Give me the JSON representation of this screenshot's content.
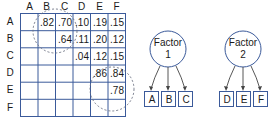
{
  "matrix": {
    "columns": [
      "A",
      "B",
      "C",
      "D",
      "E",
      "F"
    ],
    "rows": [
      "A",
      "B",
      "C",
      "D",
      "E",
      "F"
    ],
    "cells": [
      [
        "",
        ".82",
        ".70",
        ".10",
        ".19",
        ".15"
      ],
      [
        "",
        "",
        ".64",
        ".11",
        ".20",
        ".12"
      ],
      [
        "",
        "",
        "",
        ".04",
        ".12",
        ".15"
      ],
      [
        "",
        "",
        "",
        "",
        ".86",
        ".84"
      ],
      [
        "",
        "",
        "",
        "",
        "",
        ".78"
      ],
      [
        "",
        "",
        "",
        "",
        "",
        ""
      ]
    ],
    "line_color": "#3b5a9a"
  },
  "factors": [
    {
      "label_line1": "Factor",
      "label_line2": "1",
      "indicators": [
        "A",
        "B",
        "C"
      ]
    },
    {
      "label_line1": "Factor",
      "label_line2": "2",
      "indicators": [
        "D",
        "E",
        "F"
      ]
    }
  ]
}
